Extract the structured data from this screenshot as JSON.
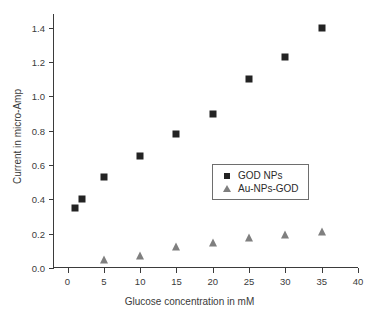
{
  "chart_data": {
    "type": "scatter",
    "title": "",
    "xlabel": "Glucose concentration in mM",
    "ylabel": "Current in micro-Amp",
    "xlim": [
      -2,
      40
    ],
    "ylim": [
      0.0,
      1.48
    ],
    "xticks": [
      0,
      5,
      10,
      15,
      20,
      25,
      30,
      35,
      40
    ],
    "xticklabels": [
      "0",
      "5",
      "10",
      "15",
      "20",
      "25",
      "30",
      "35",
      "40"
    ],
    "yticks": [
      0.0,
      0.2,
      0.4,
      0.6,
      0.8,
      1.0,
      1.2,
      1.4
    ],
    "yticklabels": [
      "0.0",
      "0.2",
      "0.4",
      "0.6",
      "0.8",
      "1.0",
      "1.2",
      "1.4"
    ],
    "grid": false,
    "legend_position": "center-right",
    "series": [
      {
        "name": "GOD NPs",
        "marker": "square",
        "color": "#232323",
        "x": [
          1,
          2,
          5,
          10,
          15,
          20,
          25,
          30,
          35
        ],
        "values": [
          0.35,
          0.4,
          0.53,
          0.65,
          0.78,
          0.9,
          1.1,
          1.23,
          1.4
        ]
      },
      {
        "name": "Au-NPs-GOD",
        "marker": "triangle",
        "color": "#7f7f7f",
        "x": [
          5,
          10,
          15,
          20,
          25,
          30,
          35
        ],
        "values": [
          0.045,
          0.07,
          0.12,
          0.145,
          0.175,
          0.19,
          0.21
        ]
      }
    ]
  },
  "legend": {
    "entries": [
      {
        "label": "GOD NPs"
      },
      {
        "label": "Au-NPs-GOD"
      }
    ]
  },
  "colors": {
    "series_1": "#232323",
    "series_2": "#7f7f7f",
    "axis": "#3b3b3b",
    "background": "#ffffff"
  }
}
